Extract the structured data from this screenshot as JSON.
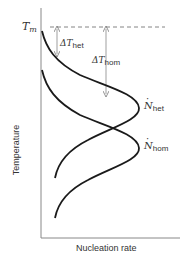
{
  "diagram": {
    "type": "nucleation-rate-vs-temperature",
    "axes": {
      "y_label": "Temperature",
      "x_label": "Nucleation rate",
      "y_reference": {
        "symbol": "T",
        "subscript": "m"
      }
    },
    "curves": [
      {
        "name": "heterogeneous",
        "symbol": "N",
        "subscript": "het",
        "dot": true
      },
      {
        "name": "homogeneous",
        "symbol": "N",
        "subscript": "hom",
        "dot": true
      }
    ],
    "undercooling": [
      {
        "symbol": "ΔT",
        "subscript": "het"
      },
      {
        "symbol": "ΔT",
        "subscript": "hom"
      }
    ],
    "colors": {
      "curve": "#1a1a1a",
      "axis": "#888888",
      "dashed": "#666666",
      "arrow": "#777777",
      "text": "#333333"
    }
  }
}
